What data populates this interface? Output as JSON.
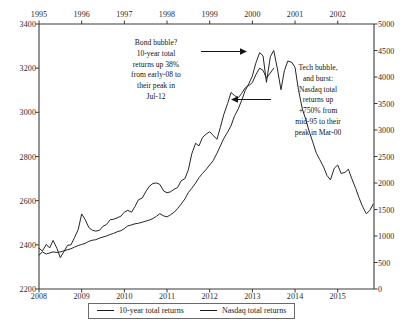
{
  "chart_data": {
    "type": "line",
    "title": "",
    "subtitle": "",
    "xlabel": "",
    "ylabel": "",
    "grid": false,
    "legend_position": "bottom",
    "axes": {
      "bottom": {
        "label": "",
        "ticks": [
          "2008",
          "2009",
          "2010",
          "2011",
          "2012",
          "2013",
          "2014",
          "2015"
        ],
        "range": [
          2008,
          2015.85
        ]
      },
      "top": {
        "label": "",
        "ticks": [
          "1995",
          "1996",
          "1997",
          "1998",
          "1999",
          "2000",
          "2001",
          "2002"
        ],
        "range": [
          1995,
          2002.85
        ]
      },
      "left": {
        "label": "",
        "ticks": [
          "3400",
          "3200",
          "3000",
          "2800",
          "2600",
          "2400",
          "2200"
        ],
        "range": [
          2200,
          3400
        ]
      },
      "right": {
        "label": "",
        "ticks": [
          "5000",
          "4500",
          "4000",
          "3500",
          "3000",
          "2500",
          "2000",
          "1500",
          "1000",
          "500",
          "0"
        ],
        "range": [
          0,
          5000
        ]
      }
    },
    "series": [
      {
        "name": "10-year total returns",
        "axis": "left",
        "x_axis": "bottom",
        "color": "#1a1a1a",
        "x": [
          2008.0,
          2008.08,
          2008.17,
          2008.25,
          2008.33,
          2008.42,
          2008.5,
          2008.58,
          2008.67,
          2008.75,
          2008.83,
          2008.92,
          2009.0,
          2009.08,
          2009.17,
          2009.25,
          2009.33,
          2009.42,
          2009.5,
          2009.58,
          2009.67,
          2009.75,
          2009.83,
          2009.92,
          2010.0,
          2010.08,
          2010.17,
          2010.25,
          2010.33,
          2010.42,
          2010.5,
          2010.58,
          2010.67,
          2010.75,
          2010.83,
          2010.92,
          2011.0,
          2011.08,
          2011.17,
          2011.25,
          2011.33,
          2011.42,
          2011.5,
          2011.58,
          2011.67,
          2011.75,
          2011.83,
          2011.92,
          2012.0,
          2012.08,
          2012.17,
          2012.25,
          2012.33,
          2012.42,
          2012.5,
          2012.58,
          2012.67,
          2012.75,
          2012.83,
          2012.92,
          2013.0,
          2013.08,
          2013.17,
          2013.25,
          2013.33,
          2013.42,
          2013.5
        ],
        "y": [
          2385,
          2372,
          2402,
          2386,
          2420,
          2384,
          2342,
          2368,
          2398,
          2400,
          2432,
          2470,
          2540,
          2515,
          2478,
          2466,
          2462,
          2466,
          2484,
          2492,
          2514,
          2516,
          2522,
          2530,
          2548,
          2556,
          2548,
          2574,
          2604,
          2612,
          2640,
          2664,
          2678,
          2680,
          2674,
          2644,
          2636,
          2640,
          2652,
          2660,
          2690,
          2700,
          2740,
          2812,
          2860,
          2848,
          2886,
          2902,
          2912,
          2896,
          2878,
          2932,
          2990,
          3040,
          3090,
          3076,
          3066,
          3086,
          3110,
          3122,
          3135,
          3170,
          3200,
          3190,
          3155,
          3178,
          3200
        ],
        "peak": {
          "value": 3220,
          "label": "Jul-12"
        }
      },
      {
        "name": "Nasdaq total returns",
        "axis": "right",
        "x_axis": "bottom",
        "color": "#1a1a1a",
        "x": [
          2008.0,
          2008.08,
          2008.17,
          2008.25,
          2008.33,
          2008.42,
          2008.5,
          2008.58,
          2008.67,
          2008.75,
          2008.83,
          2008.92,
          2009.0,
          2009.08,
          2009.17,
          2009.25,
          2009.33,
          2009.42,
          2009.5,
          2009.58,
          2009.67,
          2009.75,
          2009.83,
          2009.92,
          2010.0,
          2010.08,
          2010.17,
          2010.25,
          2010.33,
          2010.42,
          2010.5,
          2010.58,
          2010.67,
          2010.75,
          2010.83,
          2010.92,
          2011.0,
          2011.08,
          2011.17,
          2011.25,
          2011.33,
          2011.42,
          2011.5,
          2011.58,
          2011.67,
          2011.75,
          2011.83,
          2011.92,
          2012.0,
          2012.08,
          2012.17,
          2012.25,
          2012.33,
          2012.42,
          2012.5,
          2012.58,
          2012.67,
          2012.75,
          2012.83,
          2012.92,
          2013.0,
          2013.08,
          2013.17,
          2013.25,
          2013.33,
          2013.42,
          2013.5,
          2013.58,
          2013.67,
          2013.75,
          2013.83,
          2013.92,
          2014.0,
          2014.08,
          2014.17,
          2014.25,
          2014.33,
          2014.42,
          2014.5,
          2014.58,
          2014.67,
          2014.75,
          2014.83,
          2014.92,
          2015.0,
          2015.08,
          2015.17,
          2015.25,
          2015.33,
          2015.42,
          2015.5,
          2015.58,
          2015.67,
          2015.75,
          2015.83
        ],
        "y": [
          640,
          700,
          660,
          680,
          700,
          690,
          700,
          720,
          740,
          760,
          790,
          820,
          840,
          860,
          900,
          920,
          930,
          960,
          980,
          1000,
          1030,
          1050,
          1080,
          1100,
          1140,
          1190,
          1210,
          1230,
          1240,
          1260,
          1280,
          1300,
          1330,
          1370,
          1420,
          1380,
          1360,
          1400,
          1450,
          1520,
          1600,
          1700,
          1820,
          1900,
          2000,
          2100,
          2180,
          2260,
          2340,
          2420,
          2560,
          2700,
          2840,
          2960,
          3080,
          3260,
          3400,
          3560,
          3740,
          3880,
          4020,
          4260,
          4460,
          4400,
          3900,
          4380,
          4500,
          4180,
          3760,
          4120,
          4300,
          4280,
          4180,
          3760,
          3400,
          3200,
          2980,
          2760,
          2560,
          2440,
          2300,
          2140,
          2060,
          2280,
          2340,
          2180,
          2200,
          2260,
          2080,
          1900,
          1720,
          1560,
          1420,
          1480,
          1600
        ],
        "peak": {
          "value": 4500,
          "label": "Mar-00"
        }
      }
    ],
    "annotations": [
      {
        "id": "bond-bubble",
        "lines": [
          "Bond bubble?",
          "10-year total",
          "returns up 38%",
          "from early-08 to",
          "their peak in",
          "Jul-12"
        ],
        "arrow": {
          "from": [
            200,
            51
          ],
          "to": [
            243,
            51
          ]
        }
      },
      {
        "id": "tech-bubble",
        "lines": [
          "Tech bubble,",
          "and burst:",
          "Nasdaq total",
          "returns up",
          "+750% from",
          "mid-95 to their",
          "peak in Mar-00"
        ],
        "arrow": {
          "from": [
            272,
            99
          ],
          "to": [
            232,
            99
          ]
        }
      }
    ],
    "legend": [
      {
        "label": "10-year total returns",
        "color": "#1a1a1a"
      },
      {
        "label": "Nasdaq total returns",
        "color": "#1a1a1a"
      }
    ],
    "colors": {
      "axis": "#3a3a3a",
      "line": "#1a1a1a",
      "text": "#1a1a1a",
      "background": "#ffffff"
    }
  }
}
